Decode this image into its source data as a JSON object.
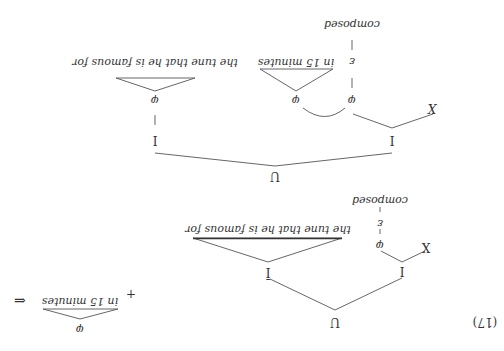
{
  "orientation": "rotated 180 degrees",
  "example_number": "(17)",
  "bottom_tree": {
    "root": "U",
    "left_child": "I",
    "left_child_children": [
      "X",
      "φ"
    ],
    "phi_chain": [
      "φ",
      "ε",
      "composed"
    ],
    "right_child": "Ī",
    "right_child_phrase": "the tune that he is famous for"
  },
  "plus": "+",
  "separate_phrase": {
    "node": "φ",
    "text": "in 15 minutes"
  },
  "arrow": "⇐",
  "top_tree": {
    "root": "U",
    "left_child": "I",
    "left_child_children": [
      "X",
      "φ"
    ],
    "phi_chain": [
      "φ",
      "ε",
      "composed"
    ],
    "attached_phrase": {
      "node": "φ",
      "text": "in 15 minutes"
    },
    "right_child": "I",
    "right_child_phi": "φ",
    "right_child_phrase": "the tune that he is famous for"
  }
}
